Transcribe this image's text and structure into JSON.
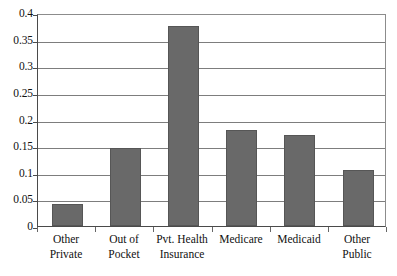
{
  "chart_data": {
    "type": "bar",
    "title": "",
    "subtitle": "",
    "xlabel": "",
    "ylabel": "",
    "categories": [
      "Other Private",
      "Out of Pocket",
      "Pvt. Health Insurance",
      "Medicare",
      "Medicaid",
      "Other Public"
    ],
    "category_lines": [
      [
        "Other",
        "Private"
      ],
      [
        "Out of",
        "Pocket"
      ],
      [
        "Pvt. Health",
        "Insurance"
      ],
      [
        "Medicare",
        ""
      ],
      [
        "Medicaid",
        ""
      ],
      [
        "Other",
        "Public"
      ]
    ],
    "values": [
      0.041,
      0.147,
      0.376,
      0.181,
      0.17,
      0.105
    ],
    "ylim": [
      0,
      0.4
    ],
    "ytick_values": [
      0,
      0.05,
      0.1,
      0.15,
      0.2,
      0.25,
      0.3,
      0.35,
      0.4
    ],
    "ytick_labels": [
      "0",
      "0.05",
      "0.1",
      "0.15",
      "0.2",
      "0.25",
      "0.3",
      "0.35",
      "0.4"
    ],
    "grid": true,
    "grid_axis": "y",
    "legend": false,
    "legend_position": "none",
    "bar_color": "#696969",
    "bar_edge_color": "#565656",
    "gridline_color": "#7d7d7d",
    "axis_color": "#4a4a4a",
    "background_color": "#ffffff",
    "text_color": "#111111"
  }
}
